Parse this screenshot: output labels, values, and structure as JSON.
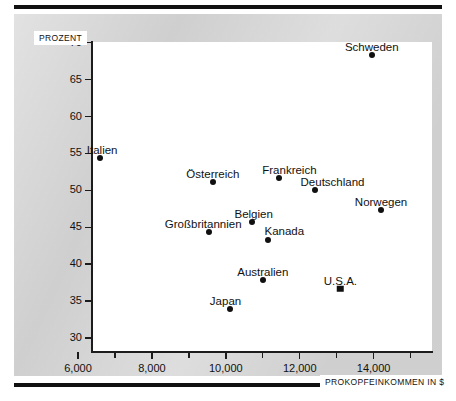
{
  "figure": {
    "background_color": "#d6d6d6",
    "plot_background_color": "#ffffff",
    "marker_color": "#101010",
    "rule_color": "#111111"
  },
  "chart_data": {
    "type": "scatter",
    "title": "",
    "subtitle": "",
    "xlabel": "PROKOPFEINKOMMEN IN $",
    "ylabel": "PROZENT",
    "xlim": [
      6000,
      15200
    ],
    "ylim": [
      30,
      72
    ],
    "grid": false,
    "legend": "none",
    "xticks": [
      6000,
      7000,
      8000,
      9000,
      10000,
      11000,
      12000,
      13000,
      14000,
      15000
    ],
    "xtick_labels": [
      "6,000",
      "",
      "8,000",
      "",
      "10,000",
      "",
      "12,000",
      "",
      "14,000",
      ""
    ],
    "yticks": [
      30,
      35,
      40,
      45,
      50,
      55,
      60,
      65,
      70
    ],
    "ytick_labels": [
      "30",
      "35",
      "40",
      "45",
      "50",
      "55",
      "60",
      "65",
      "70"
    ],
    "points": [
      {
        "label": "Schweden",
        "x": 13950,
        "y": 68.4,
        "marker": "circle",
        "label_dx": 0,
        "label_dy": -14
      },
      {
        "label": "Italien",
        "x": 6600,
        "y": 54.4,
        "marker": "circle",
        "label_dx": 2,
        "label_dy": -14
      },
      {
        "label": "Österreich",
        "x": 9650,
        "y": 51.2,
        "marker": "circle",
        "label_dx": 0,
        "label_dy": -14
      },
      {
        "label": "Frankreich",
        "x": 11450,
        "y": 51.7,
        "marker": "circle",
        "label_dx": 10,
        "label_dy": -14
      },
      {
        "label": "Deutschland",
        "x": 12400,
        "y": 50.0,
        "marker": "circle",
        "label_dx": 18,
        "label_dy": -14
      },
      {
        "label": "Norwegen",
        "x": 14200,
        "y": 47.3,
        "marker": "circle",
        "label_dx": 0,
        "label_dy": -14
      },
      {
        "label": "Belgien",
        "x": 10700,
        "y": 45.7,
        "marker": "circle",
        "label_dx": 2,
        "label_dy": -14
      },
      {
        "label": "Großbritannien",
        "x": 9550,
        "y": 44.3,
        "marker": "circle",
        "label_dx": -6,
        "label_dy": -14
      },
      {
        "label": "Kanada",
        "x": 11150,
        "y": 43.3,
        "marker": "circle",
        "label_dx": 16,
        "label_dy": -15
      },
      {
        "label": "Australien",
        "x": 11000,
        "y": 37.8,
        "marker": "circle",
        "label_dx": 0,
        "label_dy": -14
      },
      {
        "label": "U.S.A.",
        "x": 13100,
        "y": 36.7,
        "marker": "square",
        "label_dx": 0,
        "label_dy": -14
      },
      {
        "label": "Japan",
        "x": 10100,
        "y": 33.9,
        "marker": "circle",
        "label_dx": -4,
        "label_dy": -14
      }
    ]
  }
}
